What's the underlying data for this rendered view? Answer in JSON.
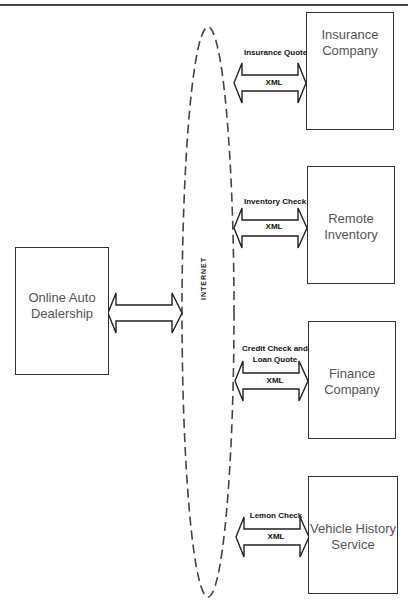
{
  "diagram": {
    "network_label": "INTERNET",
    "source": {
      "label_line1": "Online Auto",
      "label_line2": "Dealership"
    },
    "services": [
      {
        "name_line1": "Insurance",
        "name_line2": "Company",
        "message_line1": "Insurance Quote",
        "message_line2": "",
        "format": "XML"
      },
      {
        "name_line1": "Remote",
        "name_line2": "Inventory",
        "message_line1": "Inventory Check",
        "message_line2": "",
        "format": "XML"
      },
      {
        "name_line1": "Finance",
        "name_line2": "Company",
        "message_line1": "Credit Check and",
        "message_line2": "Loan Quote",
        "format": "XML"
      },
      {
        "name_line1": "Vehicle History",
        "name_line2": "Service",
        "message_line1": "Lemon Check",
        "message_line2": "",
        "format": "XML"
      }
    ],
    "colors": {
      "stroke": "#333333",
      "text": "#555555",
      "background": "#ffffff"
    }
  }
}
